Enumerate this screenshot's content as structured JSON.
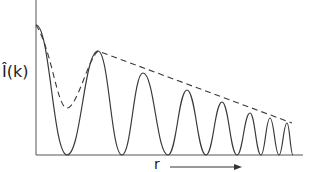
{
  "diagram": {
    "y_axis_label": "Î(k)",
    "x_axis_label": "r",
    "colors": {
      "curve": "#3a3a3a",
      "axis": "#555555",
      "background": "#ffffff"
    },
    "curve": {
      "description": "Oscillating solid curve with decaying amplitude and increasing frequency",
      "start": [
        36,
        25
      ],
      "peaks": [
        [
          98,
          51
        ],
        [
          143,
          73
        ],
        [
          187,
          90
        ],
        [
          222,
          102
        ],
        [
          250,
          113
        ],
        [
          270,
          118
        ],
        [
          287,
          123
        ]
      ],
      "minima": [
        [
          67,
          155
        ],
        [
          122,
          155
        ],
        [
          168,
          155
        ],
        [
          206,
          155
        ],
        [
          237,
          155
        ],
        [
          261,
          155
        ],
        [
          279,
          155
        ],
        [
          293,
          155
        ]
      ]
    },
    "envelope": {
      "description": "Dashed envelope curve: dips to a local minimum then follows peaks linearly",
      "points": [
        [
          36,
          25
        ],
        [
          52,
          70
        ],
        [
          67,
          108
        ],
        [
          82,
          80
        ],
        [
          98,
          51
        ],
        [
          292,
          123
        ]
      ]
    },
    "arrow": {
      "from": [
        170,
        167
      ],
      "to": [
        242,
        167
      ]
    }
  }
}
